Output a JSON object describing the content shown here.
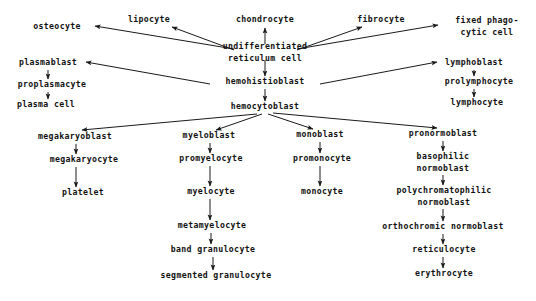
{
  "diagram": {
    "type": "flowchart",
    "background_color": "#ffffff",
    "text_color": "#111111",
    "edge_color": "#1a1a1a",
    "nodes": [
      {
        "id": "osteocyte",
        "label": "osteocyte",
        "x": 57,
        "y": 27
      },
      {
        "id": "lipocyte",
        "label": "lipocyte",
        "x": 149,
        "y": 20
      },
      {
        "id": "chondrocyte",
        "label": "chondrocyte",
        "x": 265,
        "y": 20
      },
      {
        "id": "fibrocyte",
        "label": "fibrocyte",
        "x": 381,
        "y": 20
      },
      {
        "id": "fixed-phagocytic-cell",
        "label": "fixed phago-",
        "label2": "cytic cell",
        "x": 487,
        "y": 26
      },
      {
        "id": "undifferentiated-reticulum-cell",
        "label": "undifferentiated",
        "label2": "reticulum cell",
        "x": 265,
        "y": 52
      },
      {
        "id": "plasmablast",
        "label": "plasmablast",
        "x": 48,
        "y": 63
      },
      {
        "id": "lymphoblast",
        "label": "lymphoblast",
        "x": 474,
        "y": 63
      },
      {
        "id": "proplasmacyte",
        "label": "proplasmacyte",
        "x": 52,
        "y": 85
      },
      {
        "id": "prolymphocyte",
        "label": "prolymphocyte",
        "x": 479,
        "y": 82
      },
      {
        "id": "hemohistioblast",
        "label": "hemohistioblast",
        "x": 265,
        "y": 82
      },
      {
        "id": "plasma-cell",
        "label": "plasma cell",
        "x": 46,
        "y": 105
      },
      {
        "id": "lymphocyte",
        "label": "lymphocyte",
        "x": 477,
        "y": 103
      },
      {
        "id": "hemocytoblast",
        "label": "hemocytoblast",
        "x": 265,
        "y": 107
      },
      {
        "id": "megakaryoblast",
        "label": "megakaryoblast",
        "x": 75,
        "y": 137
      },
      {
        "id": "myeloblast",
        "label": "myeloblast",
        "x": 209,
        "y": 136
      },
      {
        "id": "monoblast",
        "label": "monoblast",
        "x": 320,
        "y": 135
      },
      {
        "id": "pronormoblast",
        "label": "pronormoblast",
        "x": 443,
        "y": 134
      },
      {
        "id": "megakaryocyte",
        "label": "megakaryocyte",
        "x": 84,
        "y": 160
      },
      {
        "id": "promyelocyte",
        "label": "promyelocyte",
        "x": 211,
        "y": 159
      },
      {
        "id": "promonocyte",
        "label": "promonocyte",
        "x": 322,
        "y": 159
      },
      {
        "id": "basophilic-normoblast",
        "label": "basophilic",
        "label2": "normoblast",
        "x": 443,
        "y": 162
      },
      {
        "id": "platelet",
        "label": "platelet",
        "x": 83,
        "y": 193
      },
      {
        "id": "myelocyte",
        "label": "myelocyte",
        "x": 211,
        "y": 192
      },
      {
        "id": "monocyte",
        "label": "monocyte",
        "x": 322,
        "y": 192
      },
      {
        "id": "polychromatophilic-normoblast",
        "label": "polychromatophilic",
        "label2": "normoblast",
        "x": 444,
        "y": 196
      },
      {
        "id": "metamyelocyte",
        "label": "metamyelocyte",
        "x": 212,
        "y": 226
      },
      {
        "id": "orthochromic-normoblast",
        "label": "orthochromic normoblast",
        "x": 443,
        "y": 227
      },
      {
        "id": "band-granulocyte",
        "label": "band granulocyte",
        "x": 213,
        "y": 250
      },
      {
        "id": "reticulocyte",
        "label": "reticulocyte",
        "x": 444,
        "y": 250
      },
      {
        "id": "segmented-granulocyte",
        "label": "segmented granulocyte",
        "x": 216,
        "y": 276
      },
      {
        "id": "erythrocyte",
        "label": "erythrocyte",
        "x": 444,
        "y": 274
      }
    ],
    "edges": [
      {
        "from": "undifferentiated-reticulum-cell",
        "to": "osteocyte",
        "x1": 234,
        "y1": 49,
        "x2": 95,
        "y2": 26
      },
      {
        "from": "undifferentiated-reticulum-cell",
        "to": "lipocyte",
        "x1": 234,
        "y1": 50,
        "x2": 172,
        "y2": 27
      },
      {
        "from": "undifferentiated-reticulum-cell",
        "to": "chondrocyte",
        "x1": 265,
        "y1": 44,
        "x2": 265,
        "y2": 28
      },
      {
        "from": "undifferentiated-reticulum-cell",
        "to": "fibrocyte",
        "x1": 297,
        "y1": 50,
        "x2": 362,
        "y2": 27
      },
      {
        "from": "undifferentiated-reticulum-cell",
        "to": "fixed-phagocytic-cell",
        "x1": 297,
        "y1": 49,
        "x2": 438,
        "y2": 25
      },
      {
        "from": "undifferentiated-reticulum-cell",
        "to": "hemohistioblast",
        "x1": 265,
        "y1": 60,
        "x2": 265,
        "y2": 76
      },
      {
        "from": "hemohistioblast",
        "to": "plasmablast",
        "x1": 210,
        "y1": 84,
        "x2": 86,
        "y2": 62
      },
      {
        "from": "hemohistioblast",
        "to": "lymphoblast",
        "x1": 320,
        "y1": 84,
        "x2": 437,
        "y2": 62
      },
      {
        "from": "hemohistioblast",
        "to": "hemocytoblast",
        "x1": 265,
        "y1": 89,
        "x2": 265,
        "y2": 101
      },
      {
        "from": "plasmablast",
        "to": "proplasmacyte",
        "x1": 48,
        "y1": 70,
        "x2": 48,
        "y2": 79
      },
      {
        "from": "proplasmacyte",
        "to": "plasma-cell",
        "x1": 48,
        "y1": 92,
        "x2": 48,
        "y2": 99
      },
      {
        "from": "lymphoblast",
        "to": "prolymphocyte",
        "x1": 474,
        "y1": 70,
        "x2": 474,
        "y2": 76
      },
      {
        "from": "prolymphocyte",
        "to": "lymphocyte",
        "x1": 474,
        "y1": 89,
        "x2": 474,
        "y2": 97
      },
      {
        "from": "hemocytoblast",
        "to": "megakaryoblast",
        "x1": 257,
        "y1": 114,
        "x2": 82,
        "y2": 130
      },
      {
        "from": "hemocytoblast",
        "to": "myeloblast",
        "x1": 262,
        "y1": 114,
        "x2": 216,
        "y2": 130
      },
      {
        "from": "hemocytoblast",
        "to": "monoblast",
        "x1": 268,
        "y1": 114,
        "x2": 313,
        "y2": 129
      },
      {
        "from": "hemocytoblast",
        "to": "pronormoblast",
        "x1": 273,
        "y1": 113,
        "x2": 437,
        "y2": 128
      },
      {
        "from": "megakaryoblast",
        "to": "megakaryocyte",
        "x1": 76,
        "y1": 144,
        "x2": 76,
        "y2": 154
      },
      {
        "from": "megakaryocyte",
        "to": "platelet",
        "x1": 76,
        "y1": 167,
        "x2": 76,
        "y2": 187
      },
      {
        "from": "myeloblast",
        "to": "promyelocyte",
        "x1": 210,
        "y1": 143,
        "x2": 210,
        "y2": 153
      },
      {
        "from": "promyelocyte",
        "to": "myelocyte",
        "x1": 210,
        "y1": 166,
        "x2": 210,
        "y2": 186
      },
      {
        "from": "myelocyte",
        "to": "metamyelocyte",
        "x1": 210,
        "y1": 199,
        "x2": 210,
        "y2": 220
      },
      {
        "from": "metamyelocyte",
        "to": "band-granulocyte",
        "x1": 211,
        "y1": 233,
        "x2": 211,
        "y2": 244
      },
      {
        "from": "band-granulocyte",
        "to": "segmented-granulocyte",
        "x1": 213,
        "y1": 257,
        "x2": 213,
        "y2": 270
      },
      {
        "from": "monoblast",
        "to": "promonocyte",
        "x1": 320,
        "y1": 142,
        "x2": 320,
        "y2": 153
      },
      {
        "from": "promonocyte",
        "to": "monocyte",
        "x1": 320,
        "y1": 166,
        "x2": 320,
        "y2": 186
      },
      {
        "from": "pronormoblast",
        "to": "basophilic-normoblast",
        "x1": 443,
        "y1": 141,
        "x2": 443,
        "y2": 151
      },
      {
        "from": "basophilic-normoblast",
        "to": "polychromatophilic-normoblast",
        "x1": 443,
        "y1": 175,
        "x2": 443,
        "y2": 185
      },
      {
        "from": "polychromatophilic-normoblast",
        "to": "orthochromic-normoblast",
        "x1": 443,
        "y1": 209,
        "x2": 443,
        "y2": 221
      },
      {
        "from": "orthochromic-normoblast",
        "to": "reticulocyte",
        "x1": 443,
        "y1": 234,
        "x2": 443,
        "y2": 244
      },
      {
        "from": "reticulocyte",
        "to": "erythrocyte",
        "x1": 443,
        "y1": 257,
        "x2": 443,
        "y2": 268
      }
    ]
  }
}
